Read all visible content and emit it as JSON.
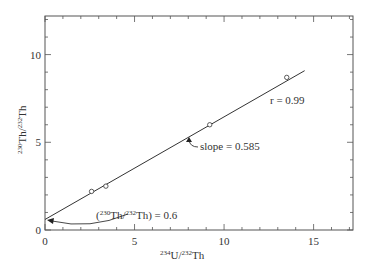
{
  "chart_data": {
    "type": "scatter",
    "title": "",
    "xlabel": "234U/232Th",
    "ylabel": "230Th/232Th",
    "xlabel_parts": {
      "sup1": "234",
      "base1": "U/",
      "sup2": "232",
      "base2": "Th"
    },
    "ylabel_parts": {
      "sup1": "230",
      "base1": "Th/",
      "sup2": "232",
      "base2": "Th"
    },
    "xlim": [
      0,
      17.2
    ],
    "ylim": [
      0,
      12.2
    ],
    "xticks": [
      0,
      5,
      10,
      15
    ],
    "yticks": [
      0,
      5,
      10
    ],
    "minor_tick_step": 1,
    "grid": false,
    "legend": null,
    "series": [
      {
        "name": "samples",
        "marker": "open-circle",
        "points": [
          {
            "x": 2.6,
            "y": 2.2
          },
          {
            "x": 3.4,
            "y": 2.5
          },
          {
            "x": 9.2,
            "y": 6.0
          },
          {
            "x": 13.5,
            "y": 8.7
          }
        ]
      }
    ],
    "fit_line": {
      "intercept": 0.6,
      "slope": 0.585,
      "x_start": 0,
      "x_end": 14.5
    },
    "annotations": [
      {
        "id": "r",
        "text": "r = 0.99",
        "x": 11.9,
        "y": 7.2
      },
      {
        "id": "slope",
        "text": "slope = 0.585",
        "x": 8.4,
        "y": 5.0
      },
      {
        "id": "intercept",
        "text_pre": "(",
        "sup1": "230",
        "mid": "Th/",
        "sup2": "232",
        "text_post": "Th) = 0.6",
        "x": 4.2,
        "y": 1.0
      }
    ]
  }
}
